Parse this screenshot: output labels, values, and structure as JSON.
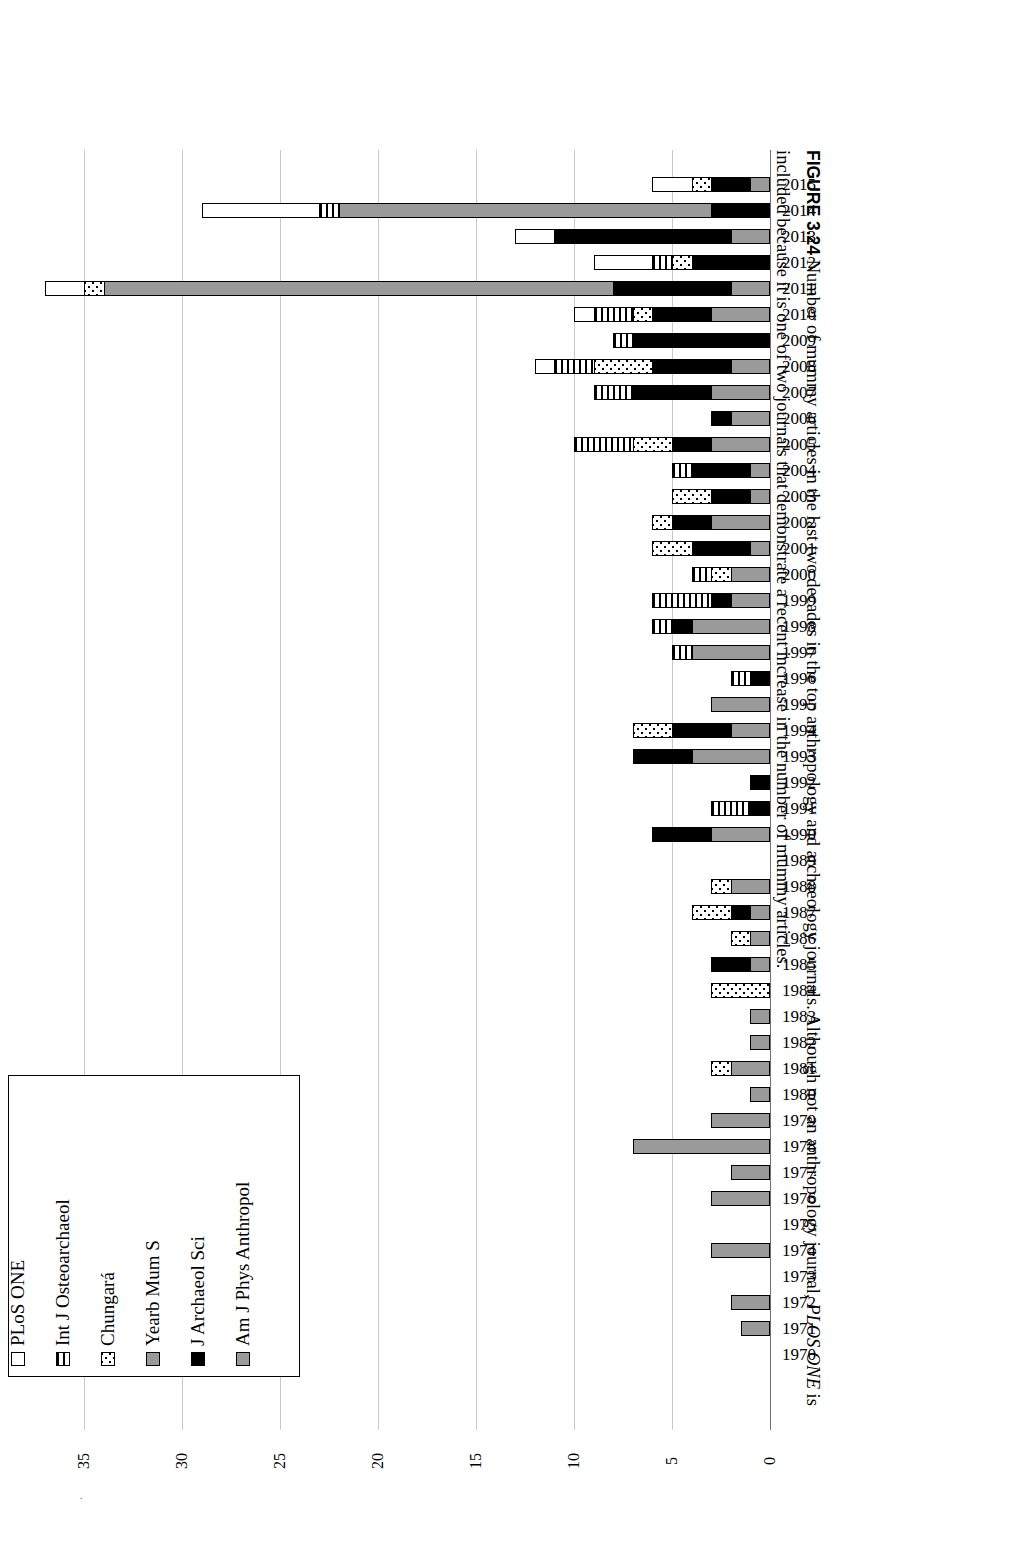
{
  "figure": {
    "number": "FIGURE 3.24",
    "caption_part1": "Number of mummy articles in the last two decades in the top anthropology and archaeology journals. Although not an anthropology journal, ",
    "caption_italic": "PLOS ONE",
    "caption_part2": " is included because it is one of two journals that demonstrate a recent increase in the number of mummy articles."
  },
  "legend": {
    "items": [
      {
        "label": "PLoS ONE",
        "key": "plos",
        "pattern": "white",
        "color": "#ffffff"
      },
      {
        "label": "Int J Osteoarchaeol",
        "key": "ijoa",
        "pattern": "vertical-stripes",
        "color": "#000000"
      },
      {
        "label": "Chungará",
        "key": "chun",
        "pattern": "dotted",
        "color": "#000000"
      },
      {
        "label": "Yearb Mum S",
        "key": "ymum",
        "pattern": "solid-gray",
        "color": "#9a9a9a"
      },
      {
        "label": "J Archaeol Sci",
        "key": "jas",
        "pattern": "solid-black",
        "color": "#000000"
      },
      {
        "label": "Am J Phys Anthropol",
        "key": "ajpa",
        "pattern": "solid-gray",
        "color": "#9a9a9a"
      }
    ]
  },
  "chart_data": {
    "type": "bar",
    "orientation": "horizontal-stacked",
    "title": "",
    "xlabel": "",
    "ylabel": "",
    "xlim": [
      0,
      37
    ],
    "xticks": [
      0,
      5,
      10,
      15,
      20,
      25,
      30,
      35
    ],
    "grid": true,
    "legend_position": "bottom-left-box",
    "categories": [
      "2015",
      "2014",
      "2013",
      "2012",
      "2011",
      "2010",
      "2009",
      "2008",
      "2007",
      "2006",
      "2005",
      "2004",
      "2003",
      "2002",
      "2001",
      "2000",
      "1999",
      "1998",
      "1997",
      "1996",
      "1995",
      "1994",
      "1993",
      "1992",
      "1991",
      "1990",
      "1989",
      "1988",
      "1987",
      "1986",
      "1985",
      "1984",
      "1983",
      "1982",
      "1981",
      "1980",
      "1979",
      "1978",
      "1977",
      "1976",
      "1975",
      "1974",
      "1973",
      "1972",
      "1971",
      "1970"
    ],
    "series": [
      {
        "name": "PLoS ONE",
        "key": "plos",
        "values": [
          2,
          6,
          2,
          3,
          2,
          1,
          0,
          1,
          0,
          0,
          0,
          0,
          0,
          0,
          0,
          0,
          0,
          0,
          0,
          0,
          0,
          0,
          0,
          0,
          0,
          0,
          0,
          0,
          0,
          0,
          0,
          0,
          0,
          0,
          0,
          0,
          0,
          0,
          0,
          0,
          0,
          0,
          0,
          0,
          0,
          0
        ]
      },
      {
        "name": "Int J Osteoarchaeol",
        "key": "ijoa",
        "values": [
          0,
          1,
          0,
          1,
          0,
          2,
          1,
          2,
          2,
          0,
          3,
          1,
          0,
          0,
          0,
          1,
          3,
          1,
          1,
          1,
          0,
          0,
          0,
          0,
          2,
          0,
          0,
          0,
          0,
          0,
          0,
          0,
          0,
          0,
          0,
          0,
          0,
          0,
          0,
          0,
          0,
          0,
          0,
          0,
          0,
          0
        ]
      },
      {
        "name": "Chungará",
        "key": "chun",
        "values": [
          1,
          0,
          0,
          1,
          1,
          1,
          0,
          3,
          0,
          0,
          2,
          0,
          2,
          1,
          2,
          1,
          0,
          0,
          0,
          0,
          0,
          2,
          0,
          0,
          0,
          0,
          0,
          1,
          2,
          1,
          0,
          3,
          0,
          0,
          1,
          0,
          0,
          0,
          0,
          0,
          0,
          0,
          0,
          0,
          0,
          0
        ]
      },
      {
        "name": "Yearb Mum S",
        "key": "ymum",
        "values": [
          0,
          19,
          0,
          0,
          26,
          0,
          0,
          0,
          0,
          0,
          0,
          0,
          0,
          0,
          0,
          0,
          0,
          0,
          0,
          0,
          0,
          0,
          0,
          0,
          0,
          0,
          0,
          0,
          0,
          0,
          0,
          0,
          0,
          0,
          0,
          0,
          0,
          0,
          0,
          0,
          0,
          0,
          0,
          0,
          0,
          0
        ]
      },
      {
        "name": "J Archaeol Sci",
        "key": "jas",
        "values": [
          2,
          3,
          9,
          4,
          6,
          3,
          7,
          4,
          4,
          1,
          2,
          3,
          2,
          2,
          3,
          0,
          1,
          1,
          0,
          1,
          0,
          3,
          3,
          1,
          1,
          3,
          0,
          0,
          1,
          0,
          2,
          0,
          0,
          0,
          0,
          0,
          0,
          0,
          0,
          0,
          0,
          0,
          0,
          0,
          0,
          0
        ]
      },
      {
        "name": "Am J Phys Anthropol",
        "key": "ajpa",
        "values": [
          1,
          0,
          2,
          0,
          2,
          3,
          0,
          2,
          3,
          2,
          3,
          1,
          1,
          3,
          1,
          2,
          2,
          4,
          4,
          0,
          3,
          2,
          4,
          0,
          0,
          3,
          0,
          2,
          1,
          1,
          1,
          0,
          1,
          1,
          2,
          1,
          3,
          7,
          2,
          3,
          0,
          3,
          0,
          2,
          1.5,
          0
        ]
      }
    ],
    "totals": [
      6,
      29,
      13,
      9,
      37,
      10,
      8,
      12,
      9,
      3,
      10,
      5,
      5,
      6,
      6,
      4,
      6,
      6,
      5,
      2,
      3,
      7,
      7,
      1,
      3,
      6,
      0,
      3,
      4,
      2,
      3,
      3,
      1,
      1,
      3,
      1,
      3,
      7,
      2,
      3,
      0,
      3,
      0,
      2,
      1.5,
      0
    ]
  }
}
